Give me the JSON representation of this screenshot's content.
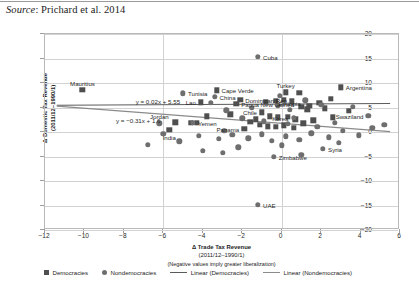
{
  "caption": {
    "source_word": "Source",
    "text": ": Prichard et al. 2014"
  },
  "chart_data": {
    "type": "scatter",
    "title": "",
    "xlabel": "Δ Trade Tax Revenue",
    "xlabel_sub": "(2011/12–1990/1)",
    "xlabel_note": "(Negative values imply greater liberalization)",
    "ylabel": "Δ Domestic Tax Revenue",
    "ylabel_sub": "(2011/12–1990/1)",
    "xlim": [
      -12,
      6
    ],
    "ylim": [
      -20,
      20
    ],
    "xticks": [
      -12,
      -10,
      -8,
      -6,
      -4,
      -2,
      0,
      2,
      4,
      6
    ],
    "yticks": [
      20,
      15,
      10,
      5,
      0,
      -5,
      -10,
      -15,
      -20
    ],
    "grid": true,
    "legend_position": "bottom",
    "colors": {
      "democracies": "#4f4f4f",
      "nondemocracies": "#6e6e6e",
      "line_democracies": "#5a5a5a",
      "line_nondemocracies": "#8a8a8a",
      "gridline": "#d2d2d2",
      "frame": "#b9b9b9"
    },
    "series": [
      {
        "name": "Democracies",
        "marker": "square",
        "points": [
          {
            "x": -10.1,
            "y": 8.6,
            "label": "Mauritius",
            "label_pos": "above"
          },
          {
            "x": -3.3,
            "y": 8.5,
            "label": "Cape Verde",
            "label_pos": "right"
          },
          {
            "x": -2.1,
            "y": 6.6,
            "label": "Dominican Rep.",
            "label_pos": "right"
          },
          {
            "x": -2.3,
            "y": 5.8,
            "label": "Papua New Guinea",
            "label_pos": "right"
          },
          {
            "x": -4.6,
            "y": 1.9,
            "label": "",
            "label_pos": ""
          },
          {
            "x": -4.3,
            "y": 1.9,
            "label": "",
            "label_pos": ""
          },
          {
            "x": -1.0,
            "y": 4.0,
            "label": "Chile",
            "label_pos": "left"
          },
          {
            "x": 3.0,
            "y": 9.1,
            "label": "Argentina",
            "label_pos": "right"
          },
          {
            "x": 1.0,
            "y": 5.2,
            "label": "",
            "label_pos": ""
          },
          {
            "x": 1.4,
            "y": 5.4,
            "label": "",
            "label_pos": ""
          },
          {
            "x": 1.3,
            "y": 4.6,
            "label": "",
            "label_pos": ""
          },
          {
            "x": 0.5,
            "y": 6.3,
            "label": "",
            "label_pos": ""
          },
          {
            "x": 0.1,
            "y": 6.6,
            "label": "",
            "label_pos": ""
          },
          {
            "x": -0.3,
            "y": 6.4,
            "label": "",
            "label_pos": ""
          },
          {
            "x": -0.8,
            "y": 6.2,
            "label": "",
            "label_pos": ""
          },
          {
            "x": 1.9,
            "y": 6.0,
            "label": "",
            "label_pos": ""
          },
          {
            "x": 2.2,
            "y": 4.8,
            "label": "",
            "label_pos": ""
          },
          {
            "x": -0.6,
            "y": 3.2,
            "label": "",
            "label_pos": ""
          },
          {
            "x": -0.2,
            "y": 3.0,
            "label": "",
            "label_pos": ""
          },
          {
            "x": 0.3,
            "y": 3.1,
            "label": "",
            "label_pos": ""
          },
          {
            "x": 0.7,
            "y": 2.6,
            "label": "",
            "label_pos": ""
          },
          {
            "x": -1.3,
            "y": 2.6,
            "label": "",
            "label_pos": ""
          },
          {
            "x": -1.6,
            "y": 2.1,
            "label": "",
            "label_pos": ""
          },
          {
            "x": -1.1,
            "y": 1.5,
            "label": "",
            "label_pos": ""
          },
          {
            "x": -0.7,
            "y": 1.2,
            "label": "",
            "label_pos": ""
          },
          {
            "x": -0.3,
            "y": 1.0,
            "label": "",
            "label_pos": ""
          },
          {
            "x": 0.1,
            "y": 1.4,
            "label": "",
            "label_pos": ""
          },
          {
            "x": 0.6,
            "y": 0.9,
            "label": "",
            "label_pos": ""
          },
          {
            "x": 1.1,
            "y": 1.8,
            "label": "",
            "label_pos": ""
          },
          {
            "x": 1.6,
            "y": 2.4,
            "label": "",
            "label_pos": ""
          },
          {
            "x": 2.6,
            "y": 3.0,
            "label": "",
            "label_pos": ""
          },
          {
            "x": -1.9,
            "y": 0.6,
            "label": "Panama",
            "label_pos": "left"
          },
          {
            "x": -2.6,
            "y": 3.6,
            "label": "",
            "label_pos": ""
          },
          {
            "x": -3.8,
            "y": 3.2,
            "label": "",
            "label_pos": ""
          },
          {
            "x": -4.1,
            "y": 6.1,
            "label": "Lao",
            "label_pos": "left"
          },
          {
            "x": -5.4,
            "y": 2.0,
            "label": "",
            "label_pos": ""
          },
          {
            "x": -5.7,
            "y": 0.4,
            "label": "India",
            "label_pos": "below"
          },
          {
            "x": 0.2,
            "y": 8.1,
            "label": "Turkey",
            "label_pos": "above"
          },
          {
            "x": 2.5,
            "y": 6.8,
            "label": "",
            "label_pos": ""
          },
          {
            "x": 3.4,
            "y": 4.3,
            "label": "",
            "label_pos": ""
          },
          {
            "x": 0.9,
            "y": 8.0,
            "label": "",
            "label_pos": ""
          }
        ]
      },
      {
        "name": "Nondemocracies",
        "marker": "circle",
        "points": [
          {
            "x": -1.2,
            "y": 15.4,
            "label": "Cuba",
            "label_pos": "right"
          },
          {
            "x": -5.0,
            "y": 7.9,
            "label": "Tunisia",
            "label_pos": "right"
          },
          {
            "x": -3.4,
            "y": 7.2,
            "label": "China",
            "label_pos": "right"
          },
          {
            "x": -3.6,
            "y": 6.0,
            "label": "",
            "label_pos": ""
          },
          {
            "x": -6.2,
            "y": 1.8,
            "label": "Jordan",
            "label_pos": "above"
          },
          {
            "x": -4.5,
            "y": 1.9,
            "label": "Yemen",
            "label_pos": "right"
          },
          {
            "x": 0.4,
            "y": 4.5,
            "label": "Ethiopia",
            "label_pos": "above"
          },
          {
            "x": 0.6,
            "y": 2.9,
            "label": "Korea",
            "label_pos": "left"
          },
          {
            "x": 4.4,
            "y": 3.3,
            "label": "Swaziland",
            "label_pos": "left"
          },
          {
            "x": -0.4,
            "y": -5.0,
            "label": "Zimbabwe",
            "label_pos": "right"
          },
          {
            "x": 2.1,
            "y": -3.4,
            "label": "Syria",
            "label_pos": "right"
          },
          {
            "x": -1.2,
            "y": -14.8,
            "label": "UAE",
            "label_pos": "right"
          },
          {
            "x": -2.9,
            "y": 0.3,
            "label": "",
            "label_pos": ""
          },
          {
            "x": -2.5,
            "y": -0.6,
            "label": "",
            "label_pos": ""
          },
          {
            "x": -3.2,
            "y": -1.4,
            "label": "",
            "label_pos": ""
          },
          {
            "x": -4.2,
            "y": -0.8,
            "label": "",
            "label_pos": ""
          },
          {
            "x": -5.2,
            "y": -1.9,
            "label": "",
            "label_pos": ""
          },
          {
            "x": -6.0,
            "y": -0.4,
            "label": "",
            "label_pos": ""
          },
          {
            "x": -6.8,
            "y": -2.6,
            "label": "",
            "label_pos": ""
          },
          {
            "x": -1.7,
            "y": -1.3,
            "label": "",
            "label_pos": ""
          },
          {
            "x": -1.0,
            "y": -0.5,
            "label": "",
            "label_pos": ""
          },
          {
            "x": -0.5,
            "y": -1.8,
            "label": "",
            "label_pos": ""
          },
          {
            "x": 0.2,
            "y": -0.9,
            "label": "",
            "label_pos": ""
          },
          {
            "x": 0.9,
            "y": -1.6,
            "label": "",
            "label_pos": ""
          },
          {
            "x": 1.5,
            "y": -0.3,
            "label": "",
            "label_pos": ""
          },
          {
            "x": 2.4,
            "y": -1.1,
            "label": "",
            "label_pos": ""
          },
          {
            "x": 3.1,
            "y": 0.2,
            "label": "",
            "label_pos": ""
          },
          {
            "x": 3.9,
            "y": -0.7,
            "label": "",
            "label_pos": ""
          },
          {
            "x": 4.6,
            "y": 0.8,
            "label": "",
            "label_pos": ""
          },
          {
            "x": 5.2,
            "y": 1.5,
            "label": "",
            "label_pos": ""
          },
          {
            "x": 1.8,
            "y": 1.0,
            "label": "",
            "label_pos": ""
          },
          {
            "x": 2.7,
            "y": 1.9,
            "label": "",
            "label_pos": ""
          },
          {
            "x": 0.3,
            "y": 1.7,
            "label": "",
            "label_pos": ""
          },
          {
            "x": -0.9,
            "y": 2.2,
            "label": "",
            "label_pos": ""
          },
          {
            "x": -2.0,
            "y": 2.8,
            "label": "",
            "label_pos": ""
          },
          {
            "x": -2.8,
            "y": 4.4,
            "label": "",
            "label_pos": ""
          },
          {
            "x": -1.5,
            "y": 5.0,
            "label": "",
            "label_pos": ""
          },
          {
            "x": -0.2,
            "y": 5.4,
            "label": "",
            "label_pos": ""
          },
          {
            "x": 1.2,
            "y": 6.5,
            "label": "",
            "label_pos": ""
          },
          {
            "x": 2.0,
            "y": 5.6,
            "label": "",
            "label_pos": ""
          },
          {
            "x": 3.6,
            "y": 5.1,
            "label": "",
            "label_pos": ""
          },
          {
            "x": -3.0,
            "y": -4.2,
            "label": "",
            "label_pos": ""
          },
          {
            "x": -4.0,
            "y": -3.8,
            "label": "",
            "label_pos": ""
          },
          {
            "x": -2.2,
            "y": -3.1,
            "label": "",
            "label_pos": ""
          },
          {
            "x": 1.0,
            "y": -4.6,
            "label": "",
            "label_pos": ""
          },
          {
            "x": 0.0,
            "y": -2.7,
            "label": "",
            "label_pos": ""
          },
          {
            "x": 2.9,
            "y": -2.2,
            "label": "",
            "label_pos": ""
          },
          {
            "x": -0.1,
            "y": 7.4,
            "label": "",
            "label_pos": ""
          }
        ]
      }
    ],
    "trendlines": [
      {
        "name": "Linear (Democracies)",
        "equation": "y = 0.02x + 5.55",
        "slope": 0.02,
        "intercept": 5.55,
        "x_start": -11.4,
        "x_end": 5.6,
        "eq_x": -7.4,
        "eq_y": 6.9
      },
      {
        "name": "Linear (Nondemocracies)",
        "equation": "y = −0.31x + 1.6",
        "slope": -0.31,
        "intercept": 1.6,
        "x_start": -11.4,
        "x_end": 5.6,
        "eq_x": -8.4,
        "eq_y": 3.1
      }
    ],
    "legend": [
      {
        "label": "Democracies",
        "marker": "square"
      },
      {
        "label": "Nondemocracies",
        "marker": "circle"
      },
      {
        "label": "Linear (Democracies)",
        "marker": "line"
      },
      {
        "label": "Linear (Nondemocracies)",
        "marker": "line-nd"
      }
    ]
  }
}
